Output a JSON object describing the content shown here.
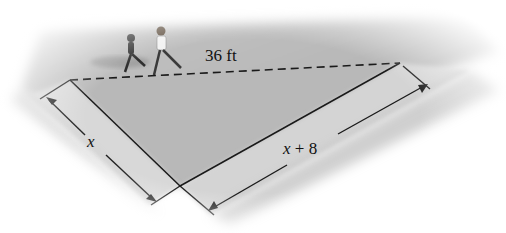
{
  "figure": {
    "type": "right-triangle-shortcut-diagram",
    "labels": {
      "hypotenuse": "36 ft",
      "short_leg": "x",
      "long_leg_var": "x",
      "long_leg_op": "+",
      "long_leg_const": "8"
    },
    "scene": "Two children running across a grassy lot along the dashed diagonal shortcut; sidewalks run along the two legs",
    "vertices": {
      "left": [
        70,
        80
      ],
      "right": [
        400,
        63
      ],
      "bottom": [
        180,
        186
      ]
    },
    "colors": {
      "lot": "#b9b9b9",
      "sidewalk": "#d6d6d6",
      "line": "#1a1a1a",
      "background": "#ffffff"
    }
  }
}
